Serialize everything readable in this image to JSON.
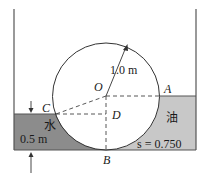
{
  "diagram": {
    "points": {
      "O": "O",
      "A": "A",
      "B": "B",
      "C": "C",
      "D": "D"
    },
    "radius_label": "1.0 m",
    "water_label": "水",
    "water_depth_label": "0.5 m",
    "oil_label": "油",
    "oil_sg_label": "s = 0.750",
    "colors": {
      "water_fill": "#8c8c8c",
      "oil_fill": "#c8c8c8",
      "lines": "#333333"
    }
  }
}
